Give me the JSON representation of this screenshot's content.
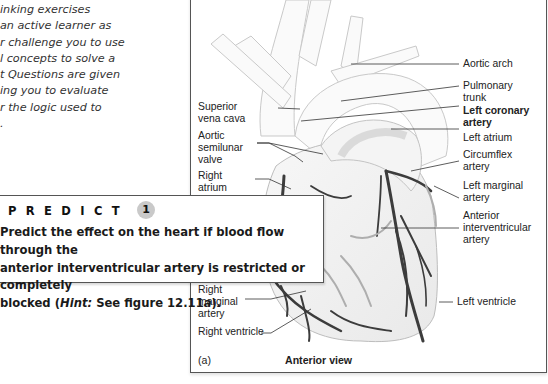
{
  "intro_text": {
    "lines": [
      "inking exercises",
      "an active learner as",
      "r challenge you to use",
      "l concepts to solve a",
      "t Questions are given",
      "ing you to evaluate",
      "r the logic used to",
      "."
    ]
  },
  "figure": {
    "panel_letter": "(a)",
    "caption": "Anterior view",
    "labels_left": [
      {
        "text": "Superior\nvena cava",
        "lines": [
          "Superior",
          "vena cava"
        ]
      },
      {
        "lines": [
          "Aortic",
          "semilunar",
          "valve"
        ]
      },
      {
        "lines": [
          "Right",
          "atrium"
        ]
      },
      {
        "lines": [
          "Right",
          "marginal",
          "artery"
        ]
      },
      {
        "lines": [
          "Right ventricle"
        ]
      }
    ],
    "labels_right": [
      {
        "lines": [
          "Aortic arch"
        ],
        "bold": false
      },
      {
        "lines": [
          "Pulmonary",
          "trunk"
        ],
        "bold": false
      },
      {
        "lines": [
          "Left coronary",
          "artery"
        ],
        "bold": true
      },
      {
        "lines": [
          "Left atrium"
        ],
        "bold": false
      },
      {
        "lines": [
          "Circumflex",
          "artery"
        ],
        "bold": false
      },
      {
        "lines": [
          "Left marginal",
          "artery"
        ],
        "bold": false
      },
      {
        "lines": [
          "Anterior",
          "interventricular",
          "artery"
        ],
        "bold": false
      },
      {
        "lines": [
          "Left ventricle"
        ],
        "bold": false
      }
    ]
  },
  "predict_box": {
    "heading": "PREDICT",
    "number": "1",
    "text_line1": "Predict the effect on the heart if blood flow through the",
    "text_line2": "anterior interventricular artery is restricted or completely",
    "text_line3_pre": "blocked (",
    "text_line3_hint": "Hint:",
    "text_line3_post": " See figure 12.11",
    "text_line3_fig": "a",
    "text_line3_end": ")."
  }
}
